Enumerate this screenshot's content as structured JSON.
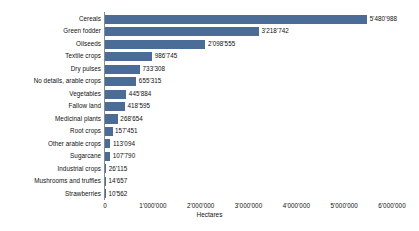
{
  "chart_data": {
    "type": "bar",
    "orientation": "horizontal",
    "title": "",
    "xlabel": "Hectares",
    "ylabel": "",
    "xlim": [
      0,
      6000000
    ],
    "grid": false,
    "legend": null,
    "bar_color": "#4a6c96",
    "tick_labels": [
      "0",
      "1'000'000",
      "2'000'000",
      "3'000'000",
      "4'000'000",
      "5'000'000",
      "6'000'000"
    ],
    "tick_values": [
      0,
      1000000,
      2000000,
      3000000,
      4000000,
      5000000,
      6000000
    ],
    "categories": [
      "Cereals",
      "Green fodder",
      "Oilseeds",
      "Textile crops",
      "Dry pulses",
      "No details, arable crops",
      "Vegetables",
      "Fallow land",
      "Medicinal plants",
      "Root crops",
      "Other arable crops",
      "Sugarcane",
      "Industrial crops",
      "Mushrooms and truffles",
      "Strawberries"
    ],
    "values": [
      5480988,
      3218742,
      2098555,
      986745,
      733308,
      655315,
      445884,
      418595,
      268654,
      157451,
      113094,
      107790,
      26115,
      14657,
      10562
    ],
    "value_labels": [
      "5'480'988",
      "3'218'742",
      "2'098'555",
      "986'745",
      "733'308",
      "655'315",
      "445'884",
      "418'595",
      "268'654",
      "157'451",
      "113'094",
      "107'790",
      "26'115",
      "14'657",
      "10'562"
    ]
  }
}
